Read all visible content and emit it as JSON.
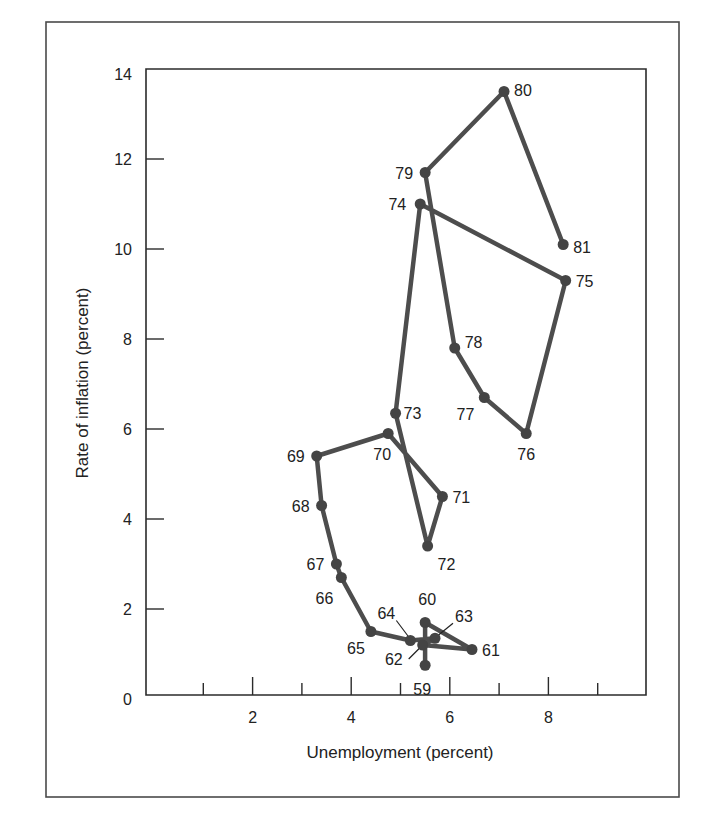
{
  "chart_data": {
    "type": "scatter",
    "subtype": "connected-scatter",
    "title": "",
    "xlabel": "Unemployment (percent)",
    "ylabel": "Rate of inflation (percent)",
    "xlim": [
      0,
      10
    ],
    "ylim": [
      0,
      14
    ],
    "x_ticks": [
      1,
      2,
      3,
      4,
      5,
      6,
      7,
      8,
      9
    ],
    "x_tick_labels": [
      "2",
      "4",
      "6",
      "8"
    ],
    "x_labeled_ticks": [
      2,
      4,
      6,
      8
    ],
    "y_ticks": [
      0,
      2,
      4,
      6,
      8,
      10,
      12,
      14
    ],
    "y_tick_labels": [
      "0",
      "2",
      "4",
      "6",
      "8",
      "10",
      "12",
      "14"
    ],
    "grid": false,
    "legend": null,
    "series": [
      {
        "name": "Inflation vs unemployment, 1959-1981",
        "points": [
          {
            "label": "59",
            "x": 5.5,
            "y": 0.75
          },
          {
            "label": "60",
            "x": 5.5,
            "y": 1.7
          },
          {
            "label": "61",
            "x": 6.45,
            "y": 1.1
          },
          {
            "label": "62",
            "x": 5.45,
            "y": 1.2
          },
          {
            "label": "63",
            "x": 5.7,
            "y": 1.35
          },
          {
            "label": "64",
            "x": 5.2,
            "y": 1.3
          },
          {
            "label": "65",
            "x": 4.4,
            "y": 1.5
          },
          {
            "label": "66",
            "x": 3.8,
            "y": 2.7
          },
          {
            "label": "67",
            "x": 3.7,
            "y": 3.0
          },
          {
            "label": "68",
            "x": 3.4,
            "y": 4.3
          },
          {
            "label": "69",
            "x": 3.3,
            "y": 5.4
          },
          {
            "label": "70",
            "x": 4.75,
            "y": 5.9
          },
          {
            "label": "71",
            "x": 5.85,
            "y": 4.5
          },
          {
            "label": "72",
            "x": 5.55,
            "y": 3.4
          },
          {
            "label": "73",
            "x": 4.9,
            "y": 6.35
          },
          {
            "label": "74",
            "x": 5.4,
            "y": 11.0
          },
          {
            "label": "75",
            "x": 8.35,
            "y": 9.3
          },
          {
            "label": "76",
            "x": 7.55,
            "y": 5.9
          },
          {
            "label": "77",
            "x": 6.7,
            "y": 6.7
          },
          {
            "label": "78",
            "x": 6.1,
            "y": 7.8
          },
          {
            "label": "79",
            "x": 5.5,
            "y": 11.7
          },
          {
            "label": "80",
            "x": 7.1,
            "y": 13.5
          },
          {
            "label": "81",
            "x": 8.3,
            "y": 10.1
          }
        ]
      }
    ]
  },
  "axes": {
    "x_title": "Unemployment (percent)",
    "y_title": "Rate of inflation (percent)"
  }
}
